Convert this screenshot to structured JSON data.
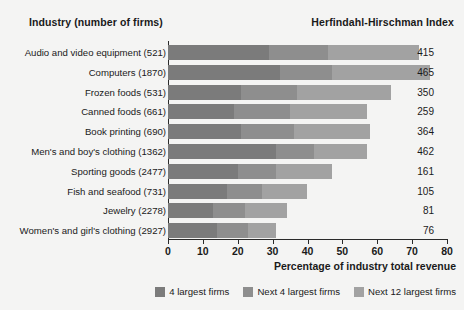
{
  "header": {
    "left_title": "Industry (number of firms)",
    "right_title": "Herfindahl-Hirschman Index"
  },
  "colors": {
    "largest4": "#7b7b7b",
    "next4": "#8e8e8e",
    "next12": "#a2a2a2",
    "axis": "#2a2a2a",
    "background": "#f4f4f3"
  },
  "chart_data": {
    "type": "bar",
    "orientation": "horizontal",
    "stacked": true,
    "title": "",
    "xlabel": "Percentage of industry total revenue",
    "ylabel": "Industry (number of firms)",
    "xlim": [
      0,
      80
    ],
    "xticks": [
      0,
      10,
      20,
      30,
      40,
      50,
      60,
      70,
      80
    ],
    "grid": false,
    "legend_position": "bottom-right",
    "categories": [
      "Audio and video equipment  (521)",
      "Computers  (1870)",
      "Frozen foods  (531)",
      "Canned foods  (661)",
      "Book printing  (690)",
      "Men's and boy's clothing  (1362)",
      "Sporting goods  (2477)",
      "Fish and seafood  (731)",
      "Jewelry  (2278)",
      "Women's and girl's clothing  (2927)"
    ],
    "industry_names": [
      "Audio and video equipment",
      "Computers",
      "Frozen foods",
      "Canned foods",
      "Book printing",
      "Men's and boy's clothing",
      "Sporting goods",
      "Fish and seafood",
      "Jewelry",
      "Women's and girl's clothing"
    ],
    "number_of_firms": [
      521,
      1870,
      531,
      661,
      690,
      1362,
      2477,
      731,
      2278,
      2927
    ],
    "series": [
      {
        "name": "4 largest firms",
        "color": "#7b7b7b",
        "values": [
          29,
          32,
          21,
          19,
          21,
          31,
          20,
          17,
          13,
          14
        ]
      },
      {
        "name": "Next 4 largest firms",
        "color": "#8e8e8e",
        "values": [
          17,
          15,
          16,
          16,
          15,
          11,
          11,
          10,
          9,
          9
        ]
      },
      {
        "name": "Next 12 largest firms",
        "color": "#a2a2a2",
        "values": [
          26,
          28,
          27,
          22,
          22,
          15,
          16,
          13,
          12,
          8
        ]
      }
    ],
    "totals": [
      72,
      75,
      64,
      57,
      58,
      57,
      47,
      40,
      34,
      31
    ],
    "hhi_label": "Herfindahl-Hirschman Index",
    "hhi_values": [
      415,
      465,
      350,
      259,
      364,
      462,
      161,
      105,
      81,
      76
    ],
    "legend": [
      "4 largest firms",
      "Next 4 largest firms",
      "Next 12 largest firms"
    ]
  }
}
